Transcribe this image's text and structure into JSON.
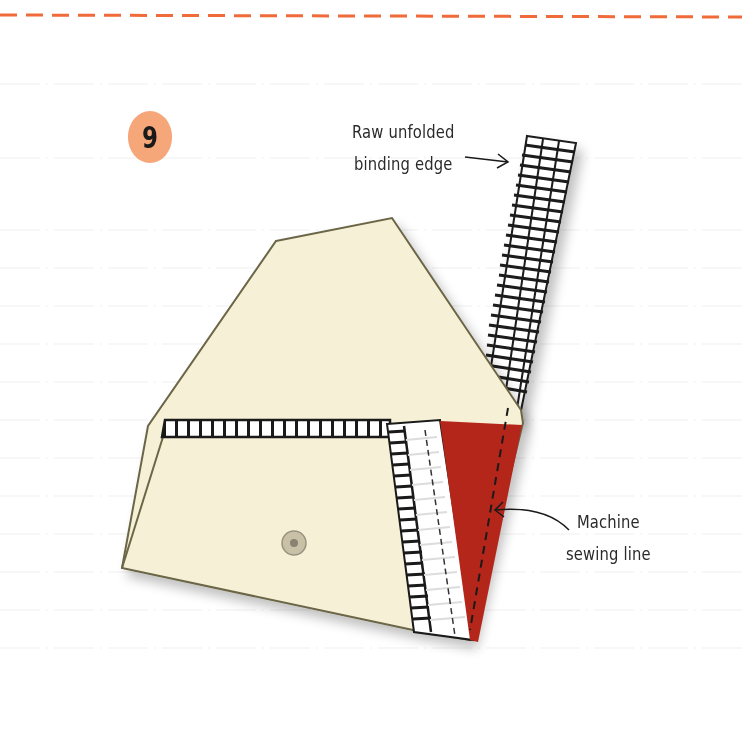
{
  "step": {
    "number": "9",
    "badge_color": "#f6a77a"
  },
  "annotations": {
    "raw_edge": {
      "line1": "Raw unfolded",
      "line2": "binding edge"
    },
    "machine_line": {
      "line1": "Machine",
      "line2": "sewing line"
    }
  },
  "colors": {
    "top_dashed_border": "#f06a3a",
    "fabric": "#f6f1d6",
    "fabric_outline": "#6b6646",
    "binding_outer": "#1a1a1a",
    "binding_inner": "#ffffff",
    "corner_fabric": "#b5261a",
    "grid_line": "#eeeeee"
  },
  "elements": {
    "button_marker": "snap-button",
    "binding_strip": "bias-binding",
    "corner_fold": "folded-red-corner"
  }
}
